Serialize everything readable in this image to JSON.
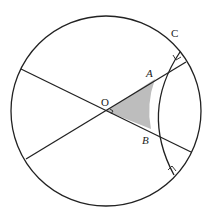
{
  "diagram": {
    "labels": {
      "O": "O",
      "A": "A",
      "B": "B",
      "C": "C"
    },
    "colors": {
      "stroke": "#222222",
      "shade": "#bdbdbd",
      "background": "#ffffff"
    },
    "circle": {
      "cx": 106,
      "cy": 111,
      "r": 95
    },
    "points": {
      "O": [
        106,
        111
      ],
      "A": [
        155,
        79
      ],
      "B": [
        151,
        129
      ],
      "C_arc_end": [
        180,
        52
      ],
      "lower_arc_end": [
        174,
        175
      ]
    },
    "right_angle_marks": 3
  }
}
